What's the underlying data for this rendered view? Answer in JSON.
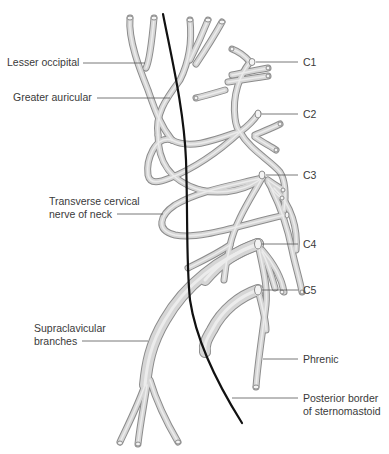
{
  "diagram": {
    "labels": {
      "lesser_occipital": "Lesser occipital",
      "greater_auricular": "Greater auricular",
      "transverse_cervical_line1": "Transverse cervical",
      "transverse_cervical_line2": "nerve of neck",
      "supraclavicular_line1": "Supraclavicular",
      "supraclavicular_line2": "branches",
      "c1": "C1",
      "c2": "C2",
      "c3": "C3",
      "c4": "C4",
      "c5": "C5",
      "phrenic": "Phrenic",
      "sternomastoid_line1": "Posterior border",
      "sternomastoid_line2": "of sternomastoid"
    },
    "colors": {
      "nerve_fill": "#d6d6d6",
      "nerve_outline": "#8c8c8c",
      "muscle_border": "#111111",
      "label_text": "#3a3a3a",
      "leader_line": "#555555",
      "background": "#ffffff"
    }
  }
}
